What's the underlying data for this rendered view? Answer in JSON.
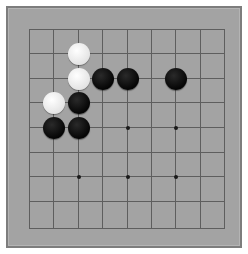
{
  "game": {
    "type": "go-board",
    "size": 9,
    "colors": {
      "board": "#a3a3a3",
      "border": "#7d7d7d",
      "line": "#5e5e5e",
      "black": "#0a0a0a",
      "white": "#f2f2f2"
    },
    "grid_x": [
      29,
      53,
      78,
      102,
      127,
      151,
      175,
      200,
      224
    ],
    "grid_y": [
      29,
      53,
      78,
      102,
      127,
      152,
      176,
      201,
      228
    ],
    "star_points": [
      [
        4,
        4
      ],
      [
        6,
        4
      ],
      [
        2,
        6
      ],
      [
        4,
        6
      ],
      [
        6,
        6
      ]
    ],
    "stones": [
      {
        "color": "white",
        "col": 2,
        "row": 1
      },
      {
        "color": "white",
        "col": 2,
        "row": 2
      },
      {
        "color": "white",
        "col": 1,
        "row": 3
      },
      {
        "color": "black",
        "col": 3,
        "row": 2
      },
      {
        "color": "black",
        "col": 4,
        "row": 2
      },
      {
        "color": "black",
        "col": 6,
        "row": 2
      },
      {
        "color": "black",
        "col": 2,
        "row": 3
      },
      {
        "color": "black",
        "col": 1,
        "row": 4
      },
      {
        "color": "black",
        "col": 2,
        "row": 4
      }
    ]
  }
}
